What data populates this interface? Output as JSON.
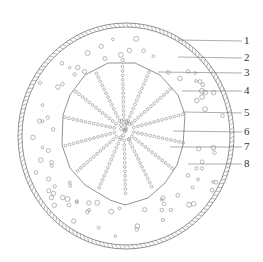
{
  "diagram": {
    "type": "plant root/stem cross-section",
    "colors": {
      "stroke": "#777777",
      "circle": "#8a8a8a",
      "text": "#333333",
      "background": "#ffffff"
    },
    "labels": [
      {
        "id": "1",
        "text": "1",
        "y": 41,
        "target": [
          178,
          40
        ]
      },
      {
        "id": "2",
        "text": "2",
        "y": 58,
        "target": [
          178,
          57
        ]
      },
      {
        "id": "3",
        "text": "3",
        "y": 73,
        "target": [
          158,
          72
        ]
      },
      {
        "id": "4",
        "text": "4",
        "y": 91,
        "target": [
          182,
          91
        ]
      },
      {
        "id": "5",
        "text": "5",
        "y": 113,
        "target": [
          183,
          112
        ]
      },
      {
        "id": "6",
        "text": "6",
        "y": 132,
        "target": [
          173,
          131
        ]
      },
      {
        "id": "7",
        "text": "7",
        "y": 147,
        "target": [
          170,
          147
        ]
      },
      {
        "id": "8",
        "text": "8",
        "y": 164,
        "target": [
          188,
          164
        ]
      }
    ]
  }
}
